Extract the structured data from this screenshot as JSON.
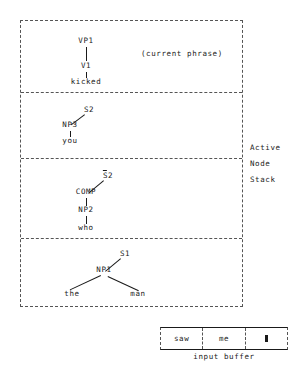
{
  "diagram": {
    "stack_caption": {
      "line1": "Active",
      "line2": "Node",
      "line3": "Stack"
    },
    "annotations": {
      "current_phrase": "(current phrase)"
    },
    "panels": [
      {
        "id": "panel-current-phrase",
        "nodes": {
          "root": "VP1",
          "mid": "V1",
          "leaf": "kicked"
        }
      },
      {
        "id": "panel-s2",
        "nodes": {
          "root": "S2",
          "mid": "NP3",
          "leaf": "you"
        }
      },
      {
        "id": "panel-sbar2",
        "nodes": {
          "root_base": "S",
          "root_index": "2",
          "comp": "COMP",
          "mid": "NP2",
          "leaf": "who"
        }
      },
      {
        "id": "panel-s1",
        "nodes": {
          "root": "S1",
          "mid": "NP1",
          "leaf_left": "the",
          "leaf_right": "man"
        }
      }
    ],
    "input_buffer": {
      "label": "input buffer",
      "cells": [
        {
          "text": "saw",
          "type": "word"
        },
        {
          "text": "me",
          "type": "word"
        },
        {
          "text": "",
          "type": "end-marker"
        }
      ]
    }
  }
}
